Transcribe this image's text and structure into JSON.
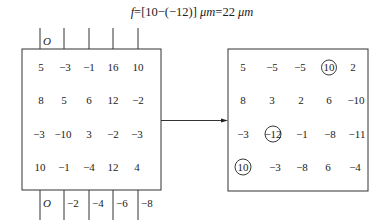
{
  "formula": {
    "text": "f=[10−(−12)] μm=22 μm",
    "variable": "f",
    "expression": "=[10−(−12)] ",
    "unit1": "μm",
    "result": "=22 ",
    "unit2": "μm"
  },
  "left_grid": {
    "top_axis_labels": [
      "O",
      "",
      "",
      "",
      ""
    ],
    "bottom_axis_labels": [
      "O",
      "−2",
      "−4",
      "−6",
      "−8"
    ],
    "rows": [
      [
        "5",
        "−3",
        "−1",
        "16",
        "10"
      ],
      [
        "8",
        "5",
        "6",
        "12",
        "−2"
      ],
      [
        "−3",
        "−10",
        "3",
        "−2",
        "−3"
      ],
      [
        "10",
        "−1",
        "−4",
        "12",
        "4"
      ]
    ]
  },
  "right_grid": {
    "rows": [
      [
        "5",
        "−5",
        "−5",
        "10",
        "2"
      ],
      [
        "8",
        "3",
        "2",
        "6",
        "−10"
      ],
      [
        "−3",
        "−12",
        "−1",
        "−8",
        "−11"
      ],
      [
        "10",
        "−3",
        "−8",
        "6",
        "−4"
      ]
    ],
    "circled": [
      {
        "row": 0,
        "col": 3,
        "value": "10"
      },
      {
        "row": 2,
        "col": 1,
        "value": "−12"
      },
      {
        "row": 3,
        "col": 0,
        "value": "10"
      }
    ]
  },
  "arrow": {
    "direction": "right"
  }
}
